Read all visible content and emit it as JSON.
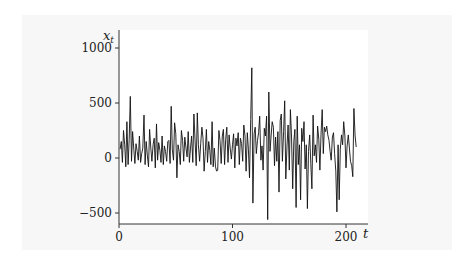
{
  "chart_data": {
    "type": "line",
    "title": "",
    "xlabel": "t",
    "ylabel": "x_t",
    "xlim": [
      0,
      218
    ],
    "ylim": [
      -600,
      1090
    ],
    "xticks": [
      0,
      100,
      200
    ],
    "yticks": [
      -500,
      0,
      500,
      1000
    ],
    "xtick_labels": [
      "0",
      "100",
      "200"
    ],
    "ytick_labels": [
      "−500",
      "0",
      "500",
      "1000"
    ],
    "grid": false,
    "legend": null,
    "series": [
      {
        "name": "x_t",
        "color": "#111111",
        "x_start": 1,
        "values": [
          80,
          150,
          -40,
          250,
          120,
          -80,
          330,
          -60,
          170,
          560,
          -30,
          240,
          80,
          -50,
          130,
          60,
          -20,
          200,
          -40,
          40,
          90,
          390,
          -60,
          150,
          20,
          -80,
          260,
          90,
          -30,
          120,
          180,
          -90,
          310,
          -20,
          140,
          70,
          -40,
          200,
          -60,
          110,
          60,
          -30,
          150,
          160,
          -50,
          470,
          80,
          -20,
          320,
          220,
          -180,
          120,
          60,
          -60,
          250,
          160,
          -30,
          190,
          90,
          10,
          240,
          -40,
          90,
          200,
          -40,
          400,
          170,
          -70,
          410,
          120,
          -30,
          130,
          280,
          180,
          -120,
          60,
          260,
          -40,
          150,
          70,
          -60,
          330,
          -80,
          90,
          -80,
          -120,
          -110,
          250,
          160,
          -50,
          200,
          260,
          -60,
          170,
          280,
          -40,
          210,
          90,
          -10,
          120,
          220,
          -90,
          180,
          110,
          230,
          -60,
          180,
          130,
          -30,
          300,
          200,
          -120,
          230,
          80,
          -180,
          350,
          820,
          -410,
          220,
          280,
          40,
          160,
          230,
          380,
          -20,
          110,
          -110,
          270,
          200,
          380,
          -560,
          600,
          60,
          200,
          330,
          280,
          -70,
          190,
          -30,
          240,
          -310,
          340,
          400,
          -30,
          240,
          520,
          -190,
          110,
          300,
          -110,
          440,
          200,
          -280,
          150,
          260,
          -450,
          380,
          -60,
          120,
          -380,
          270,
          150,
          330,
          -100,
          120,
          -460,
          60,
          210,
          -50,
          -280,
          390,
          20,
          120,
          -40,
          290,
          170,
          -110,
          210,
          440,
          40,
          280,
          240,
          290,
          210,
          160,
          60,
          -20,
          190,
          230,
          40,
          -120,
          -490,
          120,
          -380,
          80,
          210,
          120,
          330,
          200,
          -90,
          110,
          210,
          90,
          -30,
          -70,
          -170,
          450,
          200,
          100
        ]
      }
    ]
  },
  "axes": {
    "x_label": "t",
    "y_label_main": "x",
    "y_label_sub": "t"
  }
}
